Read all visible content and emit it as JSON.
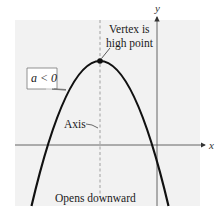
{
  "figure": {
    "type": "parabola-diagram",
    "colors": {
      "panel_background": "#f2f2f2",
      "curve": "#111111",
      "axes": "#555555",
      "axis_of_symmetry": "#a8a8a8",
      "callout_box_border": "#777777"
    }
  },
  "axes": {
    "x_label": "x",
    "y_label": "y"
  },
  "annotations": {
    "coefficient_box": "a < 0",
    "vertex_line1": "Vertex is",
    "vertex_line2": "high point",
    "axis_label": "Axis",
    "opens_label": "Opens downward"
  },
  "curve": {
    "shape": "parabola",
    "opens": "downward",
    "vertex_px": [
      100,
      61
    ],
    "x_intercepts_px": [
      48,
      152
    ]
  }
}
